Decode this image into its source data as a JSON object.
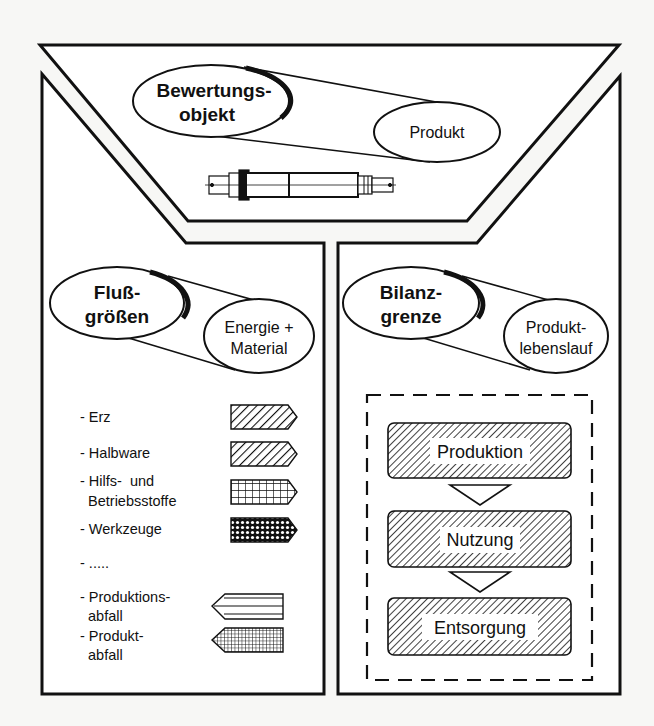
{
  "colors": {
    "background": "#f7f7f5",
    "stroke": "#111111",
    "fill": "#ffffff"
  },
  "top_section": {
    "category": [
      "Bewertungs-",
      "objekt"
    ],
    "value": [
      "Produkt"
    ],
    "illustration": "shaft-drawing"
  },
  "left_section": {
    "category": [
      "Fluß-",
      "größen"
    ],
    "value": [
      "Energie +",
      "Material"
    ],
    "legend": [
      {
        "lines": [
          "- Erz"
        ],
        "pattern": "diagonal-hatch",
        "direction": "right"
      },
      {
        "lines": [
          "- Halbware"
        ],
        "pattern": "diagonal-hatch",
        "direction": "right"
      },
      {
        "lines": [
          "- Hilfs-  und",
          "  Betriebsstoffe"
        ],
        "pattern": "grid",
        "direction": "right"
      },
      {
        "lines": [
          "- Werkzeuge"
        ],
        "pattern": "crosshatch-dense",
        "direction": "right"
      },
      {
        "lines": [
          "- ....."
        ],
        "pattern": "none",
        "direction": "none"
      },
      {
        "lines": [
          "- Produktions-",
          "  abfall"
        ],
        "pattern": "horizontal-stripes",
        "direction": "left"
      },
      {
        "lines": [
          "- Produkt-",
          "  abfall"
        ],
        "pattern": "fine-grid",
        "direction": "left"
      }
    ]
  },
  "right_section": {
    "category": [
      "Bilanz-",
      "grenze"
    ],
    "value": [
      "Produkt-",
      "lebenslauf"
    ],
    "stages": [
      "Produktion",
      "Nutzung",
      "Entsorgung"
    ]
  }
}
